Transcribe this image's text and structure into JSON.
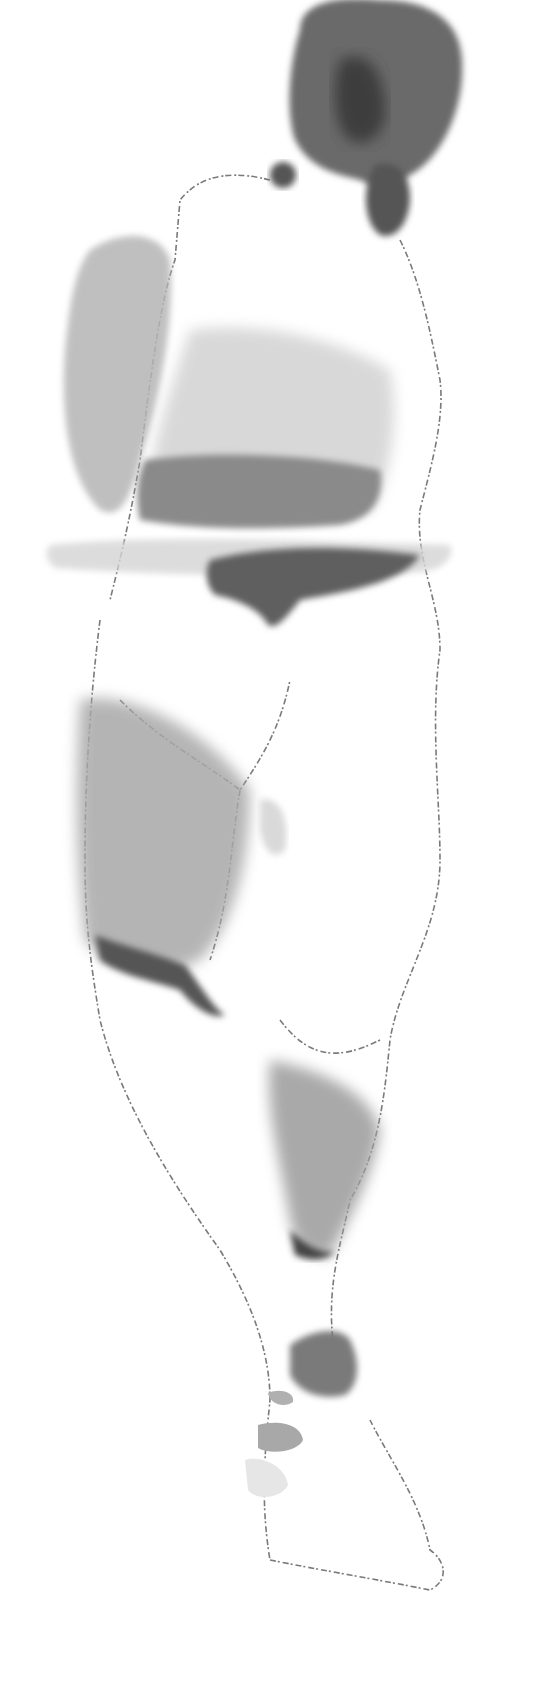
{
  "image": {
    "subject": "watercolor figure study, back view",
    "palette": {
      "paper": "#ffffff",
      "wash_light": "#d9d9d9",
      "wash_mid": "#a8a8a8",
      "wash_dark": "#5a5a5a",
      "line": "#6e6e6e"
    }
  }
}
